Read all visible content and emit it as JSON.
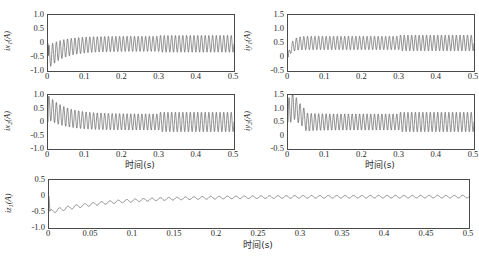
{
  "figure": {
    "background": "#ffffff",
    "line_color": "#333333",
    "axis_color": "#4a4a4a",
    "xlabel": "时间(s)",
    "unit": "(A)"
  },
  "chart_data": [
    {
      "type": "line",
      "name": "ix1",
      "title": "",
      "ylabel": "ix₁(A)",
      "ylabel_base": "ix",
      "ylabel_sub": "1",
      "ylabel_unit": "(A)",
      "xlabel": "",
      "xlim": [
        0,
        0.5
      ],
      "ylim": [
        -1.0,
        1.0
      ],
      "yticks": [
        1.0,
        0.5,
        0,
        -0.5,
        -1.0
      ],
      "ytick_labels": [
        "1.0",
        "0.5",
        "0",
        "-0.5",
        "-1.0"
      ],
      "xticks": [
        0,
        0.1,
        0.2,
        0.3,
        0.4,
        0.5
      ],
      "xtick_labels": [
        "0",
        "0.1",
        "0.2",
        "0.3",
        "0.4",
        "0.5"
      ],
      "grid": false,
      "legend": null,
      "description": "Damped oscillation starting near -0.55, envelope rising to steady band approx -0.30 to 0.25; amplitude steps up slightly after t=0.3",
      "envelope": {
        "start_mean": -0.52,
        "start_amp": 0.42,
        "settle_mean": -0.03,
        "settle_amp": 0.27,
        "settle_time": 0.09,
        "step_time": 0.3,
        "step_amp": 0.3,
        "ripple_freq_hz": 100
      }
    },
    {
      "type": "line",
      "name": "iy1",
      "title": "",
      "ylabel": "iy₁(A)",
      "ylabel_base": "iy",
      "ylabel_sub": "1",
      "ylabel_unit": "(A)",
      "xlabel": "",
      "xlim": [
        0,
        0.5
      ],
      "ylim": [
        -0.5,
        1.5
      ],
      "yticks": [
        1.5,
        1.0,
        0.5,
        0,
        -0.5
      ],
      "ytick_labels": [
        "1.5",
        "1.0",
        "0.5",
        "0",
        "-0.5"
      ],
      "xticks": [
        0,
        0.1,
        0.2,
        0.3,
        0.4,
        0.5
      ],
      "xtick_labels": [
        "0",
        "0.1",
        "0.2",
        "0.3",
        "0.4",
        "0.5"
      ],
      "grid": false,
      "legend": null,
      "description": "Rapid rise from 0 to about 0.6, then steady ripple band 0.25 to 0.75 around mean 0.5; ripple amplitude grows slightly after t=0.3",
      "envelope": {
        "start_mean": 0.0,
        "start_amp": 0.05,
        "settle_mean": 0.5,
        "settle_amp": 0.24,
        "settle_time": 0.02,
        "step_time": 0.3,
        "step_amp": 0.28,
        "ripple_freq_hz": 100
      }
    },
    {
      "type": "line",
      "name": "ix2",
      "title": "",
      "ylabel": "ix₂(A)",
      "ylabel_base": "ix",
      "ylabel_sub": "2",
      "ylabel_unit": "(A)",
      "xlabel": "时间(s)",
      "xlim": [
        0,
        0.5
      ],
      "ylim": [
        -1.0,
        1.0
      ],
      "yticks": [
        1.0,
        0.5,
        0,
        -0.5,
        -1.0
      ],
      "ytick_labels": [
        "1.0",
        "0.5",
        "0",
        "-0.5",
        "-1.0"
      ],
      "xticks": [
        0,
        0.1,
        0.2,
        0.3,
        0.4,
        0.5
      ],
      "xtick_labels": [
        "0",
        "0.1",
        "0.2",
        "0.3",
        "0.4",
        "0.5"
      ],
      "grid": false,
      "legend": null,
      "description": "Starts at about 0.9, decays to oscillation band -0.35 to 0.35 about zero mean; amplitude increases after t=0.3",
      "envelope": {
        "start_mean": 0.55,
        "start_amp": 0.45,
        "settle_mean": 0.0,
        "settle_amp": 0.3,
        "settle_time": 0.1,
        "step_time": 0.3,
        "step_amp": 0.36,
        "ripple_freq_hz": 100
      }
    },
    {
      "type": "line",
      "name": "iy2",
      "title": "",
      "ylabel": "iy₂(A)",
      "ylabel_base": "iy",
      "ylabel_sub": "2",
      "ylabel_unit": "(A)",
      "xlabel": "时间(s)",
      "xlim": [
        0,
        0.5
      ],
      "ylim": [
        -0.5,
        1.5
      ],
      "yticks": [
        1.5,
        1.0,
        0.5,
        0,
        -0.5
      ],
      "ytick_labels": [
        "1.5",
        "1.0",
        "0.5",
        "0",
        "-0.5"
      ],
      "xticks": [
        0,
        0.1,
        0.2,
        0.3,
        0.4,
        0.5
      ],
      "xtick_labels": [
        "0",
        "0.1",
        "0.2",
        "0.3",
        "0.4",
        "0.5"
      ],
      "grid": false,
      "legend": null,
      "description": "Initial overshoot peak about 1.1 near t=0.012, then ripple band 0.15 to 0.85 around mean 0.5; amplitude grows after t=0.3",
      "envelope": {
        "start_mean": 0.45,
        "start_amp": 0.65,
        "settle_mean": 0.5,
        "settle_amp": 0.3,
        "settle_time": 0.05,
        "overshoot_peak": 1.1,
        "overshoot_time": 0.012,
        "step_time": 0.3,
        "step_amp": 0.36,
        "ripple_freq_hz": 100
      }
    },
    {
      "type": "line",
      "name": "iz1",
      "title": "",
      "ylabel": "iz₁(A)",
      "ylabel_base": "iz",
      "ylabel_sub": "1",
      "ylabel_unit": "(A)",
      "xlabel": "时间(s)",
      "xlim": [
        0,
        0.5
      ],
      "ylim": [
        -1.0,
        0.5
      ],
      "yticks": [
        0.5,
        0,
        -0.5,
        -1.0
      ],
      "ytick_labels": [
        "0.5",
        "0",
        "-0.5",
        "-1.0"
      ],
      "xticks": [
        0,
        0.05,
        0.1,
        0.15,
        0.2,
        0.25,
        0.3,
        0.35,
        0.4,
        0.45,
        0.5
      ],
      "xtick_labels": [
        "0",
        "0.05",
        "0.1",
        "0.15",
        "0.2",
        "0.25",
        "0.3",
        "0.35",
        "0.4",
        "0.45",
        "0.5"
      ],
      "grid": false,
      "legend": null,
      "description": "Spike to 0 at t=0, dips to about -0.55, then exponentially recovers toward 0 with small ripple of amplitude about 0.04",
      "envelope": {
        "start_mean": -0.5,
        "start_amp": 0.06,
        "settle_mean": -0.02,
        "settle_amp": 0.04,
        "settle_time": 0.16,
        "ripple_freq_hz": 100
      }
    }
  ]
}
